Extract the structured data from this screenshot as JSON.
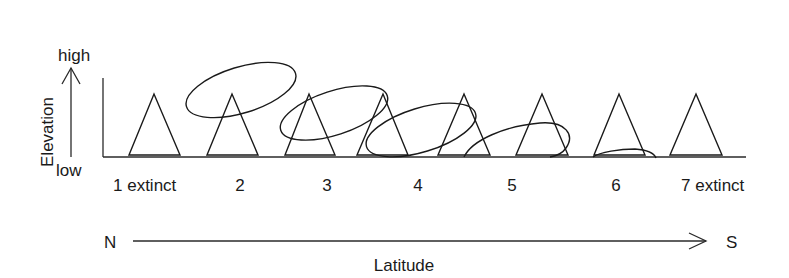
{
  "diagram": {
    "elevation_axis": {
      "title": "Elevation",
      "high_label": "high",
      "low_label": "low"
    },
    "latitude_axis": {
      "title": "Latitude",
      "start_label": "N",
      "end_label": "S"
    },
    "mountains": [
      {
        "label": "1 extinct"
      },
      {
        "label": "2"
      },
      {
        "label": "3"
      },
      {
        "label": "4"
      },
      {
        "label": "5"
      },
      {
        "label": "6"
      },
      {
        "label": "7 extinct"
      }
    ],
    "mountain_count_drawn": 8,
    "range_ellipses_count": 5,
    "colors": {
      "line": "#1a1a1a",
      "background": "#ffffff"
    }
  }
}
